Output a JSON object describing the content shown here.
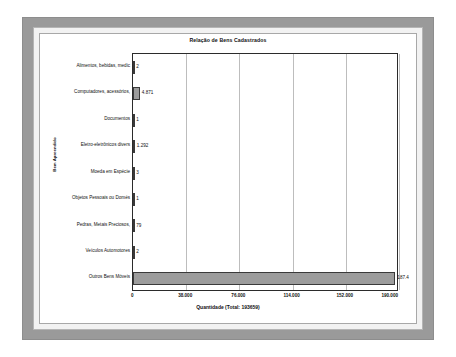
{
  "chart_data": {
    "type": "bar",
    "orientation": "horizontal",
    "title": "Relação de Bens Cadastrados",
    "xlabel": "Quantidade (Total: 193659)",
    "ylabel": "Bem Apreendido",
    "xlim": [
      0,
      190000
    ],
    "grid": true,
    "legend": "none",
    "xticks": [
      "0",
      "38.000",
      "76.000",
      "114.000",
      "152.000",
      "190.000"
    ],
    "xtick_values": [
      0,
      38000,
      76000,
      114000,
      152000,
      190000
    ],
    "categories": [
      "Alimentos, bebidas, medic",
      "Computadores, acessórios,",
      "Documentos",
      "Eletro-eletrônicos divers",
      "Moeda em Espécie",
      "Objetos Pessoais ou Domés",
      "Pedras, Metais Preciosos,",
      "Veículos Automotores",
      "Outros Bens Móveis"
    ],
    "values": [
      2,
      4871,
      1,
      1292,
      3,
      1,
      79,
      2,
      187408
    ],
    "value_labels": [
      "2",
      "4.871",
      "1",
      "1.292",
      "3",
      "1",
      "79",
      "2",
      "187.4"
    ],
    "bar_color": "#9c9c9c",
    "bar_border_color": "#3a3a3a",
    "grid_color": "#bdbdbd",
    "axis_color": "#2b2b2b",
    "total": "193659"
  }
}
